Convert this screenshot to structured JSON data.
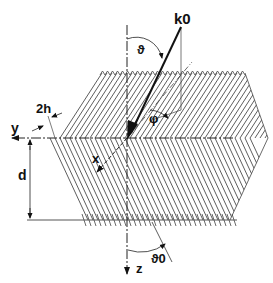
{
  "labels": {
    "k0": "k0",
    "theta": "ϑ",
    "phi": "φ",
    "two_h": "2h",
    "y_axis": "y",
    "x_axis": "x",
    "z_axis": "z",
    "d": "d",
    "theta0": "ϑ0"
  },
  "colors": {
    "line": "#222222",
    "background": "#ffffff"
  }
}
